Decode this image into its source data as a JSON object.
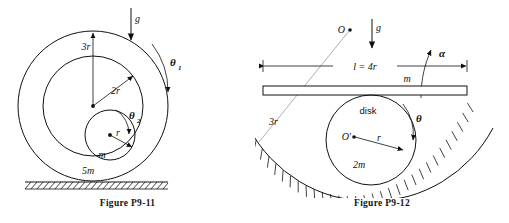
{
  "figures": [
    {
      "id": "P9-11",
      "caption": "Figure P9-11",
      "description": "Large hoop of mass 5m on ground containing an inner disk of mass m",
      "labels": {
        "gravity": "g",
        "outer_radius": "3r",
        "middle_radius": "2r",
        "inner_radius": "r",
        "inner_mass": "m",
        "outer_mass": "5m",
        "angle_outer": "θ",
        "angle_outer_sub": "1",
        "angle_inner": "θ",
        "angle_inner_sub": "2"
      }
    },
    {
      "id": "P9-12",
      "caption": "Figure P9-12",
      "description": "Bar of length 4r and mass m resting on a disk of mass 2m rolling in a curved trough of radius 3r",
      "labels": {
        "gravity": "g",
        "pivot_center": "O",
        "disk_center": "O'",
        "bar_length": "l = 4r",
        "bar_mass": "m",
        "bar_angle": "α",
        "disk_name": "disk",
        "disk_radius": "r",
        "disk_mass": "2m",
        "disk_angle": "θ",
        "surface_radius": "3r"
      }
    }
  ],
  "colors": {
    "ink": "#101010",
    "faint_line": "#9a9a9a",
    "background": "#ffffff"
  }
}
